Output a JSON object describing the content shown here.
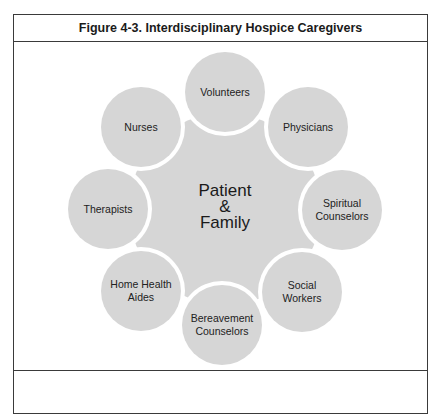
{
  "figure": {
    "title": "Figure 4-3. Interdisciplinary Hospice Caregivers"
  },
  "diagram": {
    "center": {
      "label": "Patient\n&\nFamily",
      "x": 225,
      "y": 209
    },
    "satellites": [
      {
        "label": "Volunteers",
        "x": 225,
        "y": 92
      },
      {
        "label": "Physicians",
        "x": 308,
        "y": 127
      },
      {
        "label": "Spiritual\nCounselors",
        "x": 342,
        "y": 210
      },
      {
        "label": "Social\nWorkers",
        "x": 302,
        "y": 292
      },
      {
        "label": "Bereavement\nCounselors",
        "x": 222,
        "y": 325
      },
      {
        "label": "Home Health\nAides",
        "x": 141,
        "y": 291
      },
      {
        "label": "Therapists",
        "x": 108,
        "y": 209
      },
      {
        "label": "Nurses",
        "x": 141,
        "y": 127
      }
    ],
    "colors": {
      "fill": "#d6d6d6",
      "gap": "#ffffff",
      "text": "#222222"
    }
  }
}
